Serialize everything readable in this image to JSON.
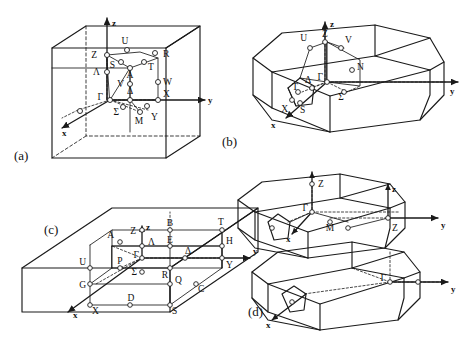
{
  "figure": {
    "caption_labels": [
      "(a)",
      "(b)",
      "(c)",
      "(d)"
    ]
  },
  "panels": [
    {
      "id": "a",
      "label": "(a)",
      "shape": "cube",
      "axes": [
        "x",
        "y",
        "z"
      ],
      "points": [
        "Z",
        "U",
        "R",
        "S",
        "A",
        "T",
        "Λ",
        "V",
        "W",
        "Γ",
        "Δ",
        "X",
        "Σ",
        "M",
        "Y"
      ]
    },
    {
      "id": "b",
      "label": "(b)",
      "shape": "truncated-polyhedron",
      "axes": [
        "x",
        "y",
        "z"
      ],
      "points": [
        "U",
        "Z",
        "V",
        "N",
        "Γ",
        "Δ",
        "Σ",
        "T",
        "X",
        "S"
      ]
    },
    {
      "id": "c",
      "label": "(c)",
      "shape": "orthorhombic-box",
      "axes": [
        "x",
        "y",
        "z"
      ],
      "points": [
        "Z",
        "B",
        "T",
        "A",
        "Λ",
        "E",
        "H",
        "Γ",
        "Δ",
        "U",
        "P",
        "Σ",
        "R",
        "Q",
        "C",
        "Y",
        "G",
        "D",
        "X",
        "S"
      ]
    },
    {
      "id": "d",
      "label": "(d)",
      "shape": "two-polyhedra",
      "axes": [
        "x",
        "y",
        "z",
        "x",
        "y",
        "z"
      ],
      "points": [
        "Z",
        "Γ",
        "M",
        "Z",
        "Γ"
      ]
    }
  ],
  "axis_labels": {
    "x": "x",
    "y": "y",
    "z": "z"
  },
  "point_labels": {
    "gamma": "Γ",
    "delta": "Δ",
    "sigma": "Σ",
    "lambda": "Λ",
    "Z": "Z",
    "U": "U",
    "R": "R",
    "S": "S",
    "A": "A",
    "T": "T",
    "V": "V",
    "W": "W",
    "X": "X",
    "M": "M",
    "Y": "Y",
    "N": "N",
    "B": "B",
    "E": "E",
    "H": "H",
    "P": "P",
    "Q": "Q",
    "C": "C",
    "G": "G",
    "D": "D"
  },
  "colors": {
    "ink": "#1a1a1a",
    "paper": "#ffffff"
  }
}
